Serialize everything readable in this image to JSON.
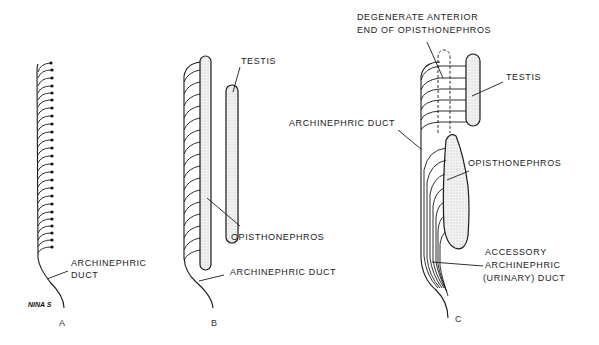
{
  "figure": {
    "panels": [
      {
        "id": "A",
        "label": "A",
        "annotations": {
          "archinephric_duct_line1": "ARCHINEPHRIC",
          "archinephric_duct_line2": "DUCT"
        },
        "signature": "NINA S"
      },
      {
        "id": "B",
        "label": "B",
        "annotations": {
          "testis": "TESTIS",
          "opisthonephros": "OPISTHONEPHROS",
          "archinephric_duct": "ARCHINEPHRIC DUCT"
        }
      },
      {
        "id": "C",
        "label": "C",
        "annotations": {
          "degenerate_line1": "DEGENERATE ANTERIOR",
          "degenerate_line2": "END OF OPISTHONEPHROS",
          "testis": "TESTIS",
          "archinephric_duct": "ARCHINEPHRIC DUCT",
          "opisthonephros": "OPISTHONEPHROS",
          "accessory_line1": "ACCESSORY",
          "accessory_line2": "ARCHINEPHRIC",
          "accessory_line3": "(URINARY)  DUCT"
        }
      }
    ]
  }
}
